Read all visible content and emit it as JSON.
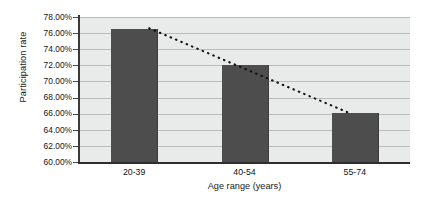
{
  "chart_data": {
    "type": "bar",
    "title": "",
    "subtitle": "",
    "xlabel": "Age range (years)",
    "ylabel": "Participation rate",
    "categories": [
      "20-39",
      "40-54",
      "55-74"
    ],
    "values": [
      76.5,
      72.0,
      66.1
    ],
    "value_labels": [
      "76.50%",
      "72.00%",
      "66.10%"
    ],
    "ylim": [
      60.0,
      78.0
    ],
    "ytick_values": [
      78.0,
      76.0,
      74.0,
      72.0,
      70.0,
      68.0,
      66.0,
      64.0,
      62.0,
      60.0
    ],
    "ytick_labels": [
      "78.00%",
      "76.00%",
      "74.00%",
      "72.00%",
      "70.00%",
      "68.00%",
      "66.00%",
      "64.00%",
      "62.00%",
      "60.00%"
    ],
    "grid": true,
    "grid_axis": "y",
    "legend": false,
    "legend_position": "none",
    "series": [
      {
        "name": "Participation rate",
        "type": "bar",
        "values": [
          76.5,
          72.0,
          66.1
        ],
        "color": "#4d4d4d"
      },
      {
        "name": "Linear trend",
        "type": "line",
        "style": "dotted",
        "color": "#111111",
        "start": {
          "x_category": "20-39",
          "y": 76.6
        },
        "end": {
          "x_category": "55-74",
          "y": 66.0
        },
        "values": [
          76.6,
          71.3,
          66.0
        ]
      }
    ],
    "plot_background": "#e9eaea",
    "gridline_color": "#b9bcbc",
    "axis_color": "#2e2e2e"
  },
  "axes": {
    "y_title": "Participation rate",
    "x_title": "Age range (years)"
  }
}
